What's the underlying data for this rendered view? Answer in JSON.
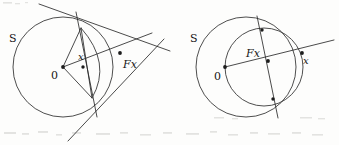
{
  "page": {
    "background_color": "#fdfdfc",
    "ink_color": "#2b2b2b",
    "width": 339,
    "height": 145
  },
  "figures": [
    {
      "id": "left-figure",
      "name": "point-inside-maps-outside",
      "caption": "",
      "circle_label": "S",
      "center_label": "0",
      "source_point_label": "x",
      "image_point_label": "Fx",
      "geometry": {
        "circle": {
          "cx": 63,
          "cy": 67,
          "r": 50
        },
        "center": {
          "x": 63,
          "y": 67
        },
        "x_point": {
          "x": 83,
          "y": 67
        },
        "fx_point": {
          "x": 120,
          "y": 53
        },
        "tangency_top": {
          "x": 81,
          "y": 28
        },
        "tangency_bottom": {
          "x": 92,
          "y": 98
        }
      },
      "labels": {
        "circle": {
          "text": "S",
          "x": 9,
          "y": 42,
          "size": 11,
          "italic": false
        },
        "center": {
          "text": "0",
          "x": 51,
          "y": 79,
          "size": 11,
          "italic": false
        },
        "x": {
          "text": "x",
          "x": 78,
          "y": 60,
          "size": 10,
          "italic": true
        },
        "fx": {
          "text": "Fx",
          "x": 123,
          "y": 68,
          "size": 11,
          "italic": true
        }
      }
    },
    {
      "id": "right-figure",
      "name": "point-outside-maps-inside",
      "caption": "",
      "circle_label": "S",
      "center_label": "0",
      "source_point_label": "x",
      "image_point_label": "Fx",
      "geometry": {
        "circle_main": {
          "cx": 246,
          "cy": 67,
          "r": 50
        },
        "circle_aux": {
          "cx": 264,
          "cy": 67,
          "r": 39
        },
        "center": {
          "x": 225,
          "y": 67
        },
        "fx_point": {
          "x": 268,
          "y": 61
        },
        "x_point": {
          "x": 302,
          "y": 53
        },
        "intersect_top": {
          "x": 262,
          "y": 30
        },
        "intersect_bottom": {
          "x": 273,
          "y": 99
        }
      },
      "labels": {
        "circle": {
          "text": "S",
          "x": 190,
          "y": 42,
          "size": 11,
          "italic": false
        },
        "center": {
          "text": "0",
          "x": 214,
          "y": 80,
          "size": 11,
          "italic": false
        },
        "fx": {
          "text": "Fx",
          "x": 246,
          "y": 57,
          "size": 11,
          "italic": true
        },
        "x": {
          "text": "x",
          "x": 303,
          "y": 64,
          "size": 10,
          "italic": true
        }
      }
    }
  ],
  "scan_artifacts": {
    "present": true,
    "description": "faint grey speckles along the top and bottom margins of the scanned page"
  }
}
